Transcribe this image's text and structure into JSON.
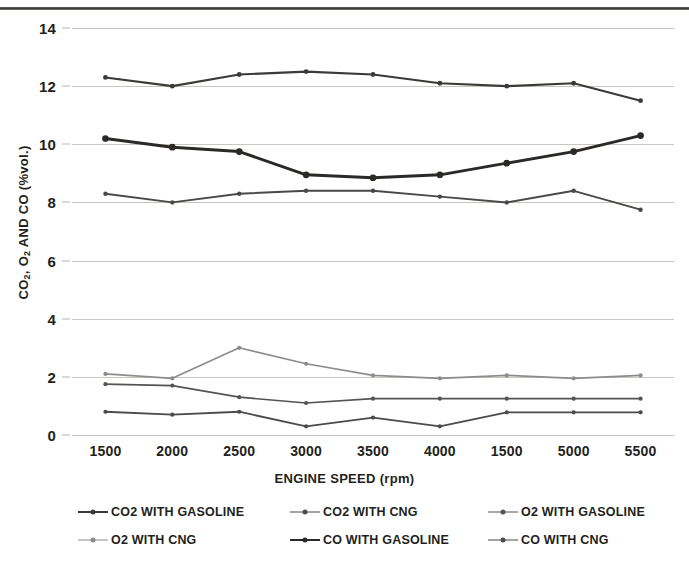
{
  "chart_data": {
    "type": "line",
    "title": "",
    "xlabel": "ENGINE SPEED (rpm)",
    "ylabel": "CO2, O2 AND CO (%vol.)",
    "ylabel_parts": {
      "a": "CO",
      "a_sub": "2",
      "b": ", O",
      "b_sub": "2",
      "c": " AND CO (%vol.)"
    },
    "categories": [
      "1500",
      "2000",
      "2500",
      "3000",
      "3500",
      "4000",
      "1500",
      "5000",
      "5500"
    ],
    "x_tick_labels": [
      "1500",
      "2000",
      "2500",
      "3000",
      "3500",
      "4000",
      "1500",
      "5000",
      "5500"
    ],
    "y_tick_labels": [
      "14",
      "12",
      "10",
      "8",
      "6",
      "4",
      "2",
      "0"
    ],
    "y_ticks": [
      14,
      12,
      10,
      8,
      6,
      4,
      2,
      0
    ],
    "ylim": [
      0,
      14
    ],
    "grid": true,
    "legend_position": "bottom",
    "series": [
      {
        "name": "CO2 WITH GASOLINE",
        "color": "#3b3a38",
        "width": 2.1,
        "values": [
          12.3,
          12.0,
          12.4,
          12.5,
          12.4,
          12.1,
          12.0,
          12.1,
          11.5
        ]
      },
      {
        "name": "CO2 WITH CNG",
        "color": "#4a4947",
        "width": 1.9,
        "values": [
          8.3,
          8.0,
          8.3,
          8.4,
          8.4,
          8.2,
          8.0,
          8.4,
          7.75
        ]
      },
      {
        "name": "O2 WITH GASOLINE",
        "color": "#565452",
        "width": 1.7,
        "values": [
          1.75,
          1.7,
          1.3,
          1.1,
          1.25,
          1.25,
          1.25,
          1.25,
          1.25
        ]
      },
      {
        "name": "O2 WITH CNG",
        "color": "#8e8c8a",
        "width": 1.7,
        "values": [
          2.1,
          1.95,
          3.0,
          2.45,
          2.05,
          1.95,
          2.05,
          1.95,
          2.05
        ]
      },
      {
        "name": "CO WITH GASOLINE",
        "color": "#2b2927",
        "width": 2.9,
        "values": [
          10.2,
          9.9,
          9.75,
          8.95,
          8.85,
          8.95,
          9.35,
          9.75,
          10.3
        ]
      },
      {
        "name": "CO WITH CNG",
        "color": "#4d4b49",
        "width": 1.8,
        "values": [
          0.8,
          0.7,
          0.8,
          0.3,
          0.6,
          0.3,
          0.78,
          0.78,
          0.78
        ]
      }
    ],
    "legend": [
      {
        "label": "CO2 WITH GASOLINE",
        "color": "#3b3a38",
        "width": 2.1
      },
      {
        "label": "CO2 WITH CNG",
        "color": "#4a4947",
        "width": 1.9
      },
      {
        "label": "O2 WITH GASOLINE",
        "color": "#565452",
        "width": 1.7
      },
      {
        "label": "O2 WITH CNG",
        "color": "#8e8c8a",
        "width": 1.7
      },
      {
        "label": "CO WITH GASOLINE",
        "color": "#2b2927",
        "width": 2.9
      },
      {
        "label": "CO WITH CNG",
        "color": "#4d4b49",
        "width": 1.8
      }
    ],
    "colors": {
      "gridline": "#c9c6c2",
      "text": "#231f20",
      "background": "#ffffff"
    }
  }
}
